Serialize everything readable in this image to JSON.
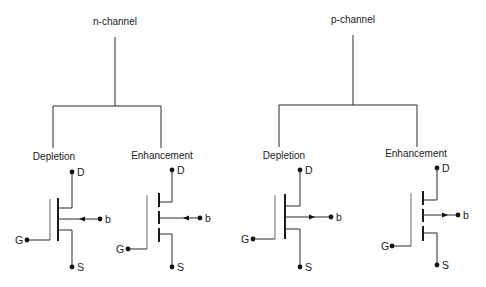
{
  "diagram": {
    "groups": [
      {
        "title": "n-channel",
        "branches": [
          {
            "label": "Depletion",
            "terminals": {
              "drain": "D",
              "gate": "G",
              "source": "S",
              "body": "b"
            }
          },
          {
            "label": "Enhancement",
            "terminals": {
              "drain": "D",
              "gate": "G",
              "source": "S",
              "body": "b"
            }
          }
        ]
      },
      {
        "title": "p-channel",
        "branches": [
          {
            "label": "Depletion",
            "terminals": {
              "drain": "D",
              "gate": "G",
              "source": "S",
              "body": "b"
            }
          },
          {
            "label": "Enhancement",
            "terminals": {
              "drain": "D",
              "gate": "G",
              "source": "S",
              "body": "b"
            }
          }
        ]
      }
    ],
    "colors": {
      "line": "#2a2a2a",
      "background": "#ffffff"
    }
  }
}
